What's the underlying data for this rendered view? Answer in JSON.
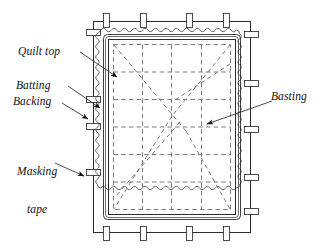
{
  "figure": {
    "background_color": "#ffffff",
    "line_color": "#1a1a1a",
    "dashed_color": "#6b6b6b",
    "width": 321,
    "height": 250
  },
  "labels": {
    "quilt_top": "Quilt top",
    "batting": "Batting",
    "backing": "Backing",
    "masking_tape_line1": "Masking",
    "masking_tape_line2": "tape",
    "basting": "Basting"
  },
  "icons": {
    "leader_arrow": "arrowhead-icon"
  },
  "components": {
    "frame": {
      "name": "outer-frame",
      "left": 93,
      "top": 21,
      "right": 251,
      "bottom": 233
    },
    "backing_edge": {
      "name": "wavy-backing-edge",
      "description": "scalloped zigzag outline representing the backing fabric edge"
    },
    "batting_edge": {
      "name": "batting-edge",
      "description": "inner double outline representing batting layer"
    },
    "quilt_top_edge": {
      "name": "quilt-top-edge",
      "description": "innermost solid rectangle representing the quilt top"
    },
    "basting_grid": {
      "name": "basting-grid",
      "columns": 4,
      "rows": 6,
      "style": "dashed"
    },
    "basting_diagonals": {
      "name": "basting-diagonals",
      "count": 6,
      "style": "dashed"
    },
    "masking_tape_tabs": {
      "name": "masking-tape-tabs",
      "top_count": 4,
      "bottom_count": 4,
      "left_count": 3,
      "right_count": 4
    }
  }
}
